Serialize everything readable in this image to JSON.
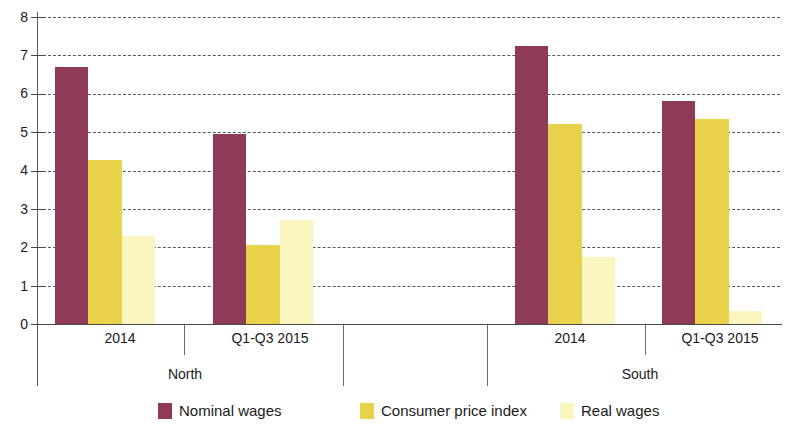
{
  "chart_data": {
    "type": "bar",
    "title": "",
    "xlabel": "",
    "ylabel": "",
    "ylim": [
      0,
      8
    ],
    "yticks": [
      0,
      1,
      2,
      3,
      4,
      5,
      6,
      7,
      8
    ],
    "ytick_labels": [
      "0",
      "1",
      "2",
      "3",
      "4",
      "5",
      "6",
      "7",
      "8"
    ],
    "grid": true,
    "legend_position": "bottom",
    "groups": [
      "North",
      "South"
    ],
    "categories": [
      "2014",
      "Q1-Q3 2015",
      "2014",
      "Q1-Q3 2015"
    ],
    "category_groups": [
      "North",
      "North",
      "South",
      "South"
    ],
    "series": [
      {
        "name": "Nominal wages",
        "color": "#8e3a58",
        "values": [
          6.7,
          4.95,
          7.25,
          5.8
        ]
      },
      {
        "name": "Consumer price index",
        "color": "#e8d24c",
        "values": [
          4.28,
          2.05,
          5.2,
          5.35
        ]
      },
      {
        "name": "Real wages",
        "color": "#fbf6c0",
        "values": [
          2.3,
          2.7,
          1.75,
          0.35
        ]
      }
    ]
  },
  "axis": {
    "tick_labels": [
      "8",
      "7",
      "6",
      "5",
      "4",
      "3",
      "2",
      "1",
      "0"
    ]
  },
  "categories": [
    {
      "label": "2014",
      "region": "North"
    },
    {
      "label": "Q1-Q3 2015",
      "region": "North"
    },
    {
      "label": "2014",
      "region": "South"
    },
    {
      "label": "Q1-Q3 2015",
      "region": "South"
    }
  ],
  "regions": [
    {
      "label": "North"
    },
    {
      "label": "South"
    }
  ],
  "legend": {
    "items": [
      {
        "label": "Nominal wages",
        "color": "#8e3a58"
      },
      {
        "label": "Consumer price index",
        "color": "#e8d24c"
      },
      {
        "label": "Real wages",
        "color": "#fbf6c0"
      }
    ]
  }
}
